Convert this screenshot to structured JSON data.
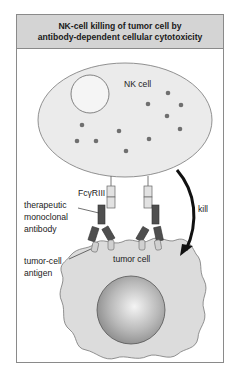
{
  "title": {
    "line1": "NK-cell killing of tumor cell by",
    "line2": "antibody-dependent cellular cytotoxicity"
  },
  "labels": {
    "nk_cell": "NK cell",
    "receptor": "FcγRIII",
    "antibody_line1": "therapeutic",
    "antibody_line2": "monoclonal",
    "antibody_line3": "antibody",
    "antigen_line1": "tumor-cell",
    "antigen_line2": "antigen",
    "tumor_cell": "tumor cell",
    "kill": "kill"
  },
  "colors": {
    "header_bg": "#d4d4d4",
    "nk_cell_fill": "#ebebeb",
    "granule": "#6f6f6f",
    "antibody": "#4f4f4f",
    "receptor": "#e2e2e2",
    "tumor_fill": "#dcdcdc",
    "arrow": "#111111"
  }
}
